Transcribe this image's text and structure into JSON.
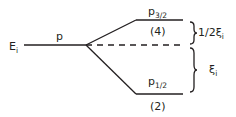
{
  "diagram": {
    "initial_level": {
      "label": "E",
      "subscript": "i"
    },
    "orbital_label": "p",
    "upper_level": {
      "label": "p",
      "subscript": "3/2",
      "degeneracy": "(4)"
    },
    "lower_level": {
      "label": "p",
      "subscript": "1/2",
      "degeneracy": "(2)"
    },
    "upper_gap": {
      "label": "1/2ξ",
      "subscript": "i"
    },
    "lower_gap": {
      "label": "ξ",
      "subscript": "i"
    },
    "colors": {
      "line": "#231f20",
      "background": "#ffffff"
    }
  }
}
